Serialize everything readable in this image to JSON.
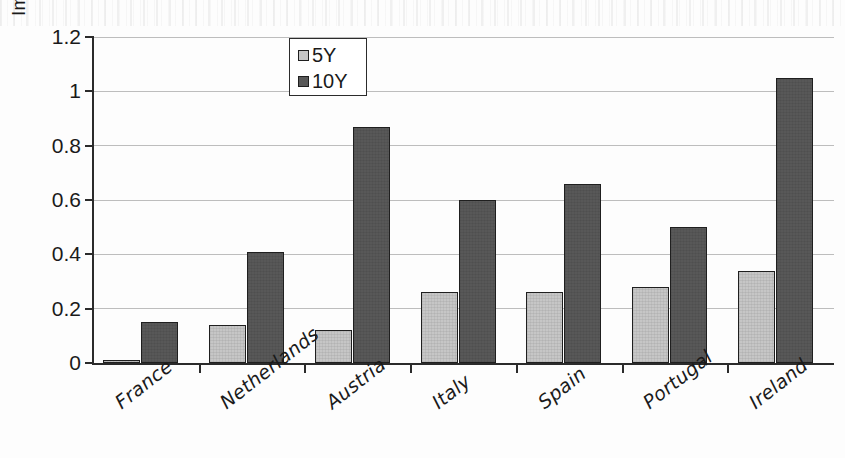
{
  "chart_data": {
    "type": "bar",
    "title": "",
    "subtitle": "",
    "xlabel": "",
    "ylabel": "Implied probability",
    "categories": [
      "France",
      "Netherlands",
      "Austria",
      "Italy",
      "Spain",
      "Portugal",
      "Ireland"
    ],
    "series": [
      {
        "name": "5Y",
        "color": "#c6c6c6",
        "values": [
          0.01,
          0.14,
          0.12,
          0.26,
          0.26,
          0.28,
          0.34
        ]
      },
      {
        "name": "10Y",
        "color": "#585858",
        "values": [
          0.15,
          0.41,
          0.87,
          0.6,
          0.66,
          0.5,
          1.05
        ]
      }
    ],
    "ylim": [
      0,
      1.2
    ],
    "yticks": [
      0,
      0.2,
      0.4,
      0.6,
      0.8,
      1,
      1.2
    ],
    "ytick_labels": [
      "0",
      "0.2",
      "0.4",
      "0.6",
      "0.8",
      "1",
      "1.2"
    ],
    "grid": "horizontal",
    "legend_position": "top-center",
    "legend_entries": [
      "5Y",
      "10Y"
    ]
  },
  "axis": {
    "y_title": "Implied probability"
  },
  "legend": {
    "items": [
      {
        "label": "5Y"
      },
      {
        "label": "10Y"
      }
    ]
  }
}
